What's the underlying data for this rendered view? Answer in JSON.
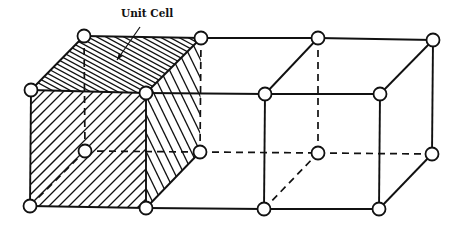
{
  "diagram": {
    "title": "Unit Cell",
    "annotation": {
      "label": "Unit Cell",
      "label_x": 121,
      "label_y": 17,
      "arrow_from": [
        140,
        27
      ],
      "arrow_to": [
        117,
        60
      ]
    },
    "colors": {
      "line": "#111111",
      "node_fill": "#ffffff",
      "background": "#ffffff"
    },
    "nodes": {
      "front_top": [
        [
          31,
          90
        ],
        [
          146,
          93
        ],
        [
          265,
          94
        ],
        [
          380,
          94
        ]
      ],
      "front_bottom": [
        [
          30,
          206
        ],
        [
          146,
          208
        ],
        [
          264,
          209
        ],
        [
          379,
          209
        ]
      ],
      "back_top": [
        [
          84,
          36
        ],
        [
          201,
          38
        ],
        [
          318,
          38
        ],
        [
          433,
          40
        ]
      ],
      "back_bottom": [
        [
          85,
          151
        ],
        [
          200,
          152
        ],
        [
          318,
          153
        ],
        [
          432,
          154
        ]
      ]
    },
    "node_radius": 6.5,
    "shaded_cell_index": 0,
    "cell_count": 3
  }
}
